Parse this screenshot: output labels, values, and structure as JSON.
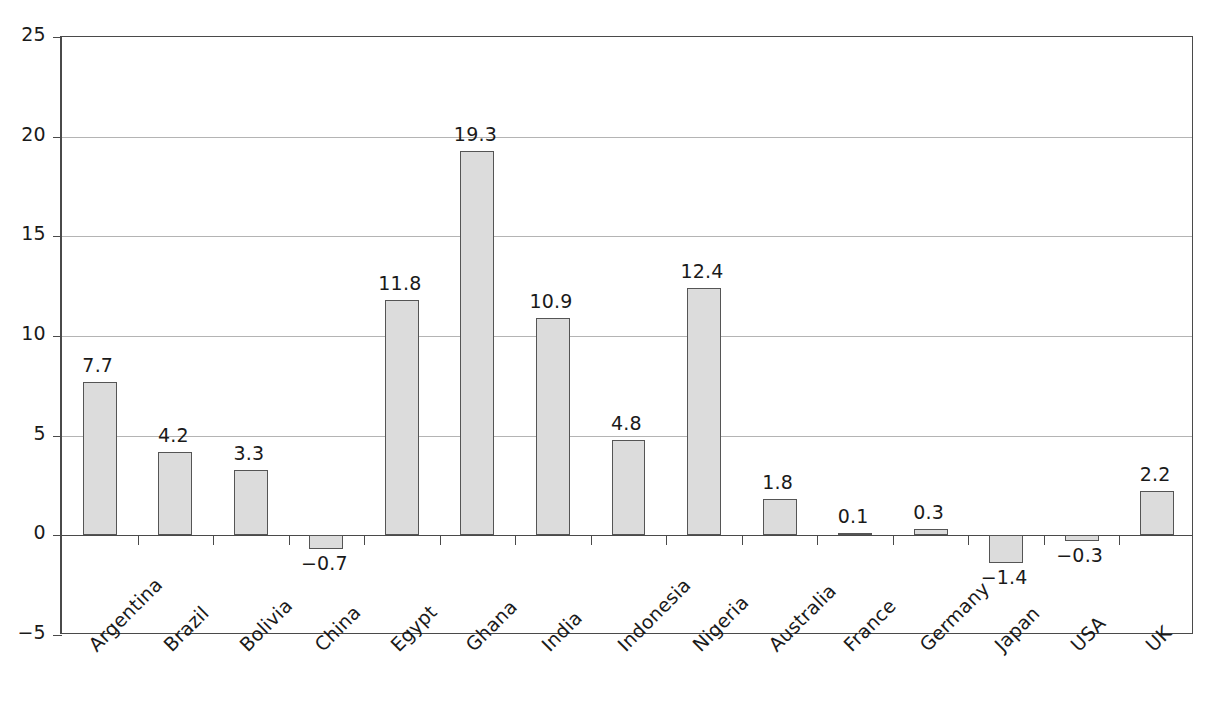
{
  "chart_data": {
    "type": "bar",
    "title": "",
    "subtitle": "",
    "xlabel": "",
    "ylabel": "",
    "categories": [
      "Argentina",
      "Brazil",
      "Bolivia",
      "China",
      "Egypt",
      "Ghana",
      "India",
      "Indonesia",
      "Nigeria",
      "Australia",
      "France",
      "Germany",
      "Japan",
      "USA",
      "UK"
    ],
    "values": [
      7.7,
      4.2,
      3.3,
      -0.7,
      11.8,
      19.3,
      10.9,
      4.8,
      12.4,
      1.8,
      0.1,
      0.3,
      -1.4,
      -0.3,
      2.2
    ],
    "value_labels": [
      "7.7",
      "4.2",
      "3.3",
      "−0.7",
      "11.8",
      "19.3",
      "10.9",
      "4.8",
      "12.4",
      "1.8",
      "0.1",
      "0.3",
      "−1.4",
      "−0.3",
      "2.2"
    ],
    "ylim": [
      -5,
      25
    ],
    "yticks": [
      25,
      20,
      15,
      10,
      5,
      0,
      -5
    ],
    "ytick_labels": [
      "25",
      "20",
      "15",
      "10",
      "5",
      "0",
      "−5"
    ],
    "grid": true,
    "grid_axis": "y",
    "legend": null,
    "legend_position": "none",
    "bar_fill_color": "#dcdcdc",
    "bar_border_color": "#555555",
    "gridline_color": "#b4b4b4",
    "axis_color": "#4a4a4a",
    "text_color": "#1a1a1a",
    "xtick_label_rotation": -45
  }
}
